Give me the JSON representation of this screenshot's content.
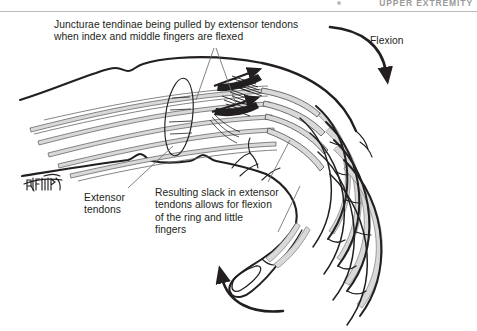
{
  "figure": {
    "domain_label": "anatomical-illustration",
    "page_header": "UPPER EXTREMITY",
    "background_color": "#ffffff",
    "ink_color": "#231f20",
    "tendon_fill_color": "#d9d9d9",
    "rule_color": "#b9b9b9",
    "width": 477,
    "height": 331
  },
  "captions": {
    "junctura": "Juncturae tendinae being pulled by extensor tendons\nwhen index and middle fingers are flexed",
    "flexion": "Flexion",
    "extensor_tendons": "Extensor\ntendons",
    "resulting_slack": "Resulting slack in extensor\ntendons allows for flexion\nof the ring and little\nfingers"
  },
  "signature": {
    "text": "Battista",
    "description": "handwritten artist signature"
  },
  "anatomy": {
    "parts": [
      "forearm-dorsum",
      "extensor-retinaculum",
      "extensor-digitorum-tendons",
      "juncturae-tendinae",
      "index-finger",
      "middle-finger",
      "ring-finger",
      "little-finger",
      "thumb",
      "metacarpal-heads"
    ]
  },
  "arrows": {
    "flexion_arrow": "curved arrow sweeping down over the fingers",
    "thumb_arrow": "curved arrow sweeping up toward the flexed fingertips",
    "tension_arrows": "short dark arrowheads on the juncturae tendinae showing pull"
  }
}
